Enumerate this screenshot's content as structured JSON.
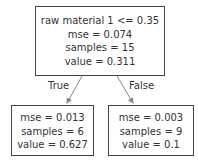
{
  "tree": {
    "root": {
      "lines": [
        "raw material 1 <= 0.35",
        "mse = 0.074",
        "samples = 15",
        "value = 0.311"
      ]
    },
    "left": {
      "lines": [
        "mse = 0.013",
        "samples = 6",
        "value = 0.627"
      ]
    },
    "right": {
      "lines": [
        "mse = 0.003",
        "samples = 9",
        "value = 0.1"
      ]
    },
    "edges": {
      "true_label": "True",
      "false_label": "False"
    }
  },
  "colors": {
    "border": "#444444",
    "edge": "#888888",
    "text": "#333333"
  }
}
